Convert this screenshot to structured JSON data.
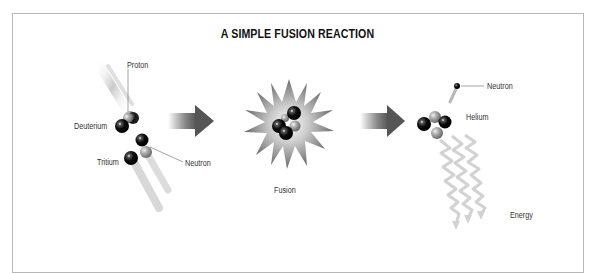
{
  "title": "A SIMPLE FUSION REACTION",
  "labels": {
    "proton": "Proton",
    "deuterium": "Deuterium",
    "tritium": "Tritium",
    "neutron_in": "Neutron",
    "fusion": "Fusion",
    "neutron_out": "Neutron",
    "helium": "Helium",
    "energy": "Energy"
  },
  "stages": [
    {
      "name": "reactants",
      "particles": [
        "Deuterium",
        "Tritium"
      ]
    },
    {
      "name": "fusion",
      "label": "Fusion"
    },
    {
      "name": "products",
      "particles": [
        "Helium",
        "Neutron",
        "Energy"
      ]
    }
  ],
  "colors": {
    "frame": "#b8b8b8",
    "neutron": "#111111",
    "proton": "#9a9a9a",
    "arrow": "#555555",
    "energy": "#cfcfcf"
  }
}
